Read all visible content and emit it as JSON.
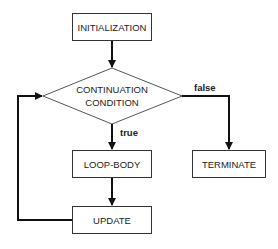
{
  "diagram": {
    "type": "flowchart",
    "nodes": {
      "initialization": "INITIALIZATION",
      "condition_line1": "CONTINUATION",
      "condition_line2": "CONDITION",
      "loop_body": "LOOP-BODY",
      "update": "UPDATE",
      "terminate": "TERMINATE"
    },
    "edges": {
      "true_label": "true",
      "false_label": "false"
    },
    "colors": {
      "stroke": "#333333",
      "arrow": "#111111"
    }
  }
}
